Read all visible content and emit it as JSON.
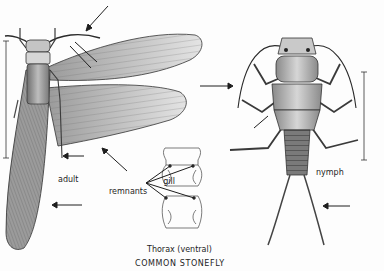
{
  "figure": {
    "title": "COMMON STONEFLY",
    "subjects": [
      {
        "id": "adult",
        "label": "adult"
      },
      {
        "id": "nymph",
        "label": "nymph"
      }
    ],
    "inset": {
      "caption": "Thorax (ventral)",
      "annotation_line1": "gill",
      "annotation_line2": "remnants"
    },
    "palette": {
      "ink": "#1e1e1e",
      "shade": "#8a8a8a",
      "light_shade": "#c8c8c8",
      "paper": "#fdfdfd"
    }
  }
}
